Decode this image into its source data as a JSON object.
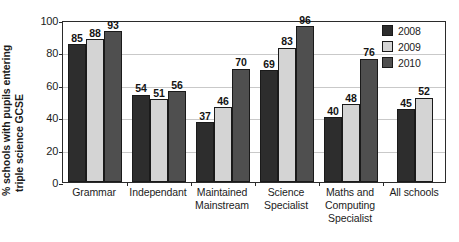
{
  "chart_data": {
    "type": "bar",
    "title": "",
    "xlabel": "",
    "ylabel": "% schools with pupils entering triple science GCSE",
    "ylabel_lines": [
      "% schools with pupils entering",
      "triple science GCSE"
    ],
    "ylim": [
      0,
      100
    ],
    "yticks": [
      100,
      80,
      60,
      40,
      20,
      0
    ],
    "grid": true,
    "legend_position": "top-right",
    "categories": [
      "Grammar",
      "Independant",
      "Maintained Mainstream",
      "Science Specialist",
      "Maths and Computing Specialist",
      "All schools"
    ],
    "category_lines": [
      [
        "Grammar"
      ],
      [
        "Independant"
      ],
      [
        "Maintained",
        "Mainstream"
      ],
      [
        "Science",
        "Specialist"
      ],
      [
        "Maths and",
        "Computing",
        "Specialist"
      ],
      [
        "All schools"
      ]
    ],
    "series": [
      {
        "name": "2008",
        "color": "#2d2d2d",
        "values": [
          85,
          54,
          37,
          69,
          40,
          45
        ]
      },
      {
        "name": "2009",
        "color": "#d4d4d4",
        "values": [
          88,
          51,
          46,
          83,
          48,
          52
        ]
      },
      {
        "name": "2010",
        "color": "#4f4f4f",
        "values": [
          93,
          56,
          70,
          96,
          76,
          null
        ]
      }
    ]
  },
  "legend": {
    "items": [
      {
        "label": "2008",
        "color": "#2d2d2d"
      },
      {
        "label": "2009",
        "color": "#d4d4d4"
      },
      {
        "label": "2010",
        "color": "#4f4f4f"
      }
    ]
  },
  "axis": {
    "y_tick_labels": [
      "100",
      "80",
      "60",
      "40",
      "20",
      "0"
    ]
  }
}
